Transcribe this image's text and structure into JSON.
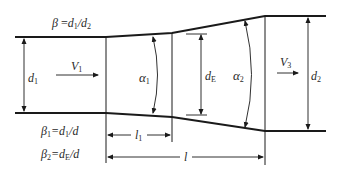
{
  "diagram": {
    "labels": {
      "beta": "β =d₁/d₂",
      "beta_main": "β",
      "beta_eq": " =",
      "beta_num": "d",
      "beta_num_sub": "1",
      "beta_den": "/d",
      "beta_den_sub": "2",
      "beta1_sym": "β",
      "beta1_sub": "1",
      "beta1_eq": "=d",
      "beta1_num_sub": "1",
      "beta1_den": "/d",
      "beta2_sym": "β",
      "beta2_sub": "2",
      "beta2_eq": "=d",
      "beta2_num_sub": "E",
      "beta2_den": "/d",
      "d1": "d",
      "d1_sub": "1",
      "V1": "V",
      "V1_sub": "1",
      "alpha1": "α",
      "alpha1_sub": "1",
      "dE": "d",
      "dE_sub": "E",
      "alpha2": "α",
      "alpha2_sub": "2",
      "V3": "V",
      "V3_sub": "3",
      "d2": "d",
      "d2_sub": "2",
      "l1": "l",
      "l1_sub": "1",
      "l": "l"
    },
    "colors": {
      "line": "#1a1a1a",
      "text": "#2a2a2a",
      "background": "#ffffff"
    }
  }
}
